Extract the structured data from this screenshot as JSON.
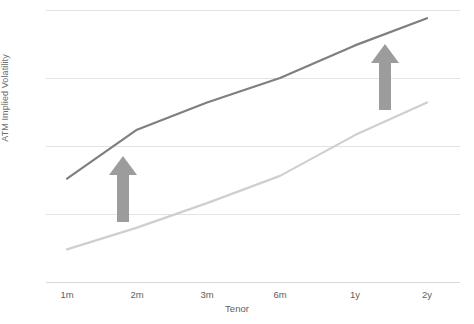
{
  "chart_data": {
    "type": "line",
    "title": "",
    "xlabel": "Tenor",
    "ylabel": "ATM Implied Volatility",
    "categories": [
      "1m",
      "2m",
      "3m",
      "6m",
      "1y",
      "2y"
    ],
    "grid": true,
    "legend": false,
    "gridlines_y": [
      0,
      25,
      50,
      75,
      100
    ],
    "ylim": [
      0,
      100
    ],
    "series": [
      {
        "name": "upper-curve",
        "color": "#7f7f7f",
        "values": [
          38,
          56,
          66,
          75,
          87,
          97
        ]
      },
      {
        "name": "lower-curve",
        "color": "#cfcfcf",
        "values": [
          12,
          20,
          29,
          39,
          54,
          66
        ]
      }
    ],
    "annotations": [
      {
        "name": "left-up-arrow",
        "x_category": "2m",
        "color": "#9c9c9c",
        "direction": "up"
      },
      {
        "name": "right-up-arrow",
        "x_category": "1y",
        "color": "#9c9c9c",
        "direction": "up"
      }
    ]
  },
  "axis": {
    "x_ticks": [
      "1m",
      "2m",
      "3m",
      "6m",
      "1y",
      "2y"
    ],
    "x_title": "Tenor",
    "y_title": "ATM Implied Volatility"
  },
  "colors": {
    "upper_line": "#7f7f7f",
    "lower_line": "#cfcfcf",
    "gridline": "#e3e3e3",
    "arrow": "#9c9c9c",
    "tick_text": "#5e5e5e",
    "axis_title": "#6f6f6f",
    "background": "#ffffff"
  }
}
